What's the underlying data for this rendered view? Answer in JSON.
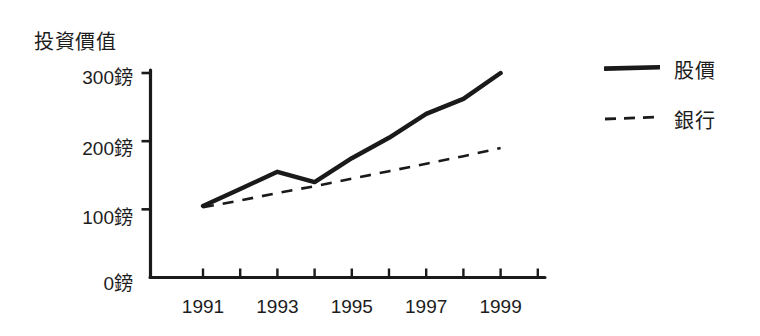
{
  "chart_data": {
    "type": "line",
    "title": "投資價值",
    "xlabel": "",
    "ylabel": "投資價值",
    "grid": false,
    "legend_position": "right",
    "x": [
      1991,
      1992,
      1993,
      1994,
      1995,
      1996,
      1997,
      1998,
      1999
    ],
    "xlim": [
      1990.6,
      2000.4
    ],
    "ylim": [
      0,
      310
    ],
    "y_ticks": [
      0,
      100,
      200,
      300
    ],
    "y_tick_labels": [
      "0鎊",
      "100鎊",
      "200鎊",
      "300鎊"
    ],
    "x_ticks": [
      1991,
      1992,
      1993,
      1994,
      1995,
      1996,
      1997,
      1998,
      1999,
      2000
    ],
    "x_tick_labels": [
      "1991",
      "",
      "1993",
      "",
      "1995",
      "",
      "1997",
      "",
      "1999",
      ""
    ],
    "x_labeled_ticks": [
      {
        "value": 1991,
        "label": "1991"
      },
      {
        "value": 1993,
        "label": "1993"
      },
      {
        "value": 1995,
        "label": "1995"
      },
      {
        "value": 1997,
        "label": "1997"
      },
      {
        "value": 1999,
        "label": "1999"
      }
    ],
    "series": [
      {
        "name": "股價",
        "style": "solid",
        "color": "#1a1a1a",
        "values": [
          105,
          130,
          155,
          140,
          175,
          205,
          240,
          262,
          300
        ]
      },
      {
        "name": "銀行",
        "style": "dashed",
        "color": "#1a1a1a",
        "values": [
          103,
          113,
          124,
          134,
          145,
          156,
          167,
          178,
          190
        ]
      }
    ]
  },
  "axes": {
    "y_title": "投資價值",
    "y_tick_labels": [
      "300鎊",
      "200鎊",
      "100鎊",
      "0鎊"
    ],
    "x_tick_labels": [
      "1991",
      "1993",
      "1995",
      "1997",
      "1999"
    ]
  },
  "legend": {
    "items": [
      {
        "label": "股價",
        "style": "solid"
      },
      {
        "label": "銀行",
        "style": "dashed"
      }
    ]
  },
  "colors": {
    "ink": "#1a1a1a",
    "background": "#ffffff"
  }
}
